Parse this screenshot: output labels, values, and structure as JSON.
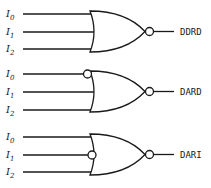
{
  "diagram": {
    "type": "logic-gates",
    "gates": [
      {
        "name": "DDRD",
        "gate_type": "NOR",
        "output_label": "DDRD",
        "inputs": [
          {
            "label": "I",
            "sub": "0",
            "inverted": false
          },
          {
            "label": "I",
            "sub": "1",
            "inverted": false
          },
          {
            "label": "I",
            "sub": "2",
            "inverted": false
          }
        ]
      },
      {
        "name": "DARD",
        "gate_type": "NOR",
        "output_label": "DARD",
        "inputs": [
          {
            "label": "I",
            "sub": "0",
            "inverted": true
          },
          {
            "label": "I",
            "sub": "1",
            "inverted": false
          },
          {
            "label": "I",
            "sub": "2",
            "inverted": false
          }
        ]
      },
      {
        "name": "DARI",
        "gate_type": "NOR",
        "output_label": "DARI",
        "inputs": [
          {
            "label": "I",
            "sub": "0",
            "inverted": false
          },
          {
            "label": "I",
            "sub": "1",
            "inverted": true
          },
          {
            "label": "I",
            "sub": "2",
            "inverted": false
          }
        ]
      }
    ],
    "colors": {
      "stroke": "#1a1a1a",
      "background": "#ffffff"
    }
  }
}
